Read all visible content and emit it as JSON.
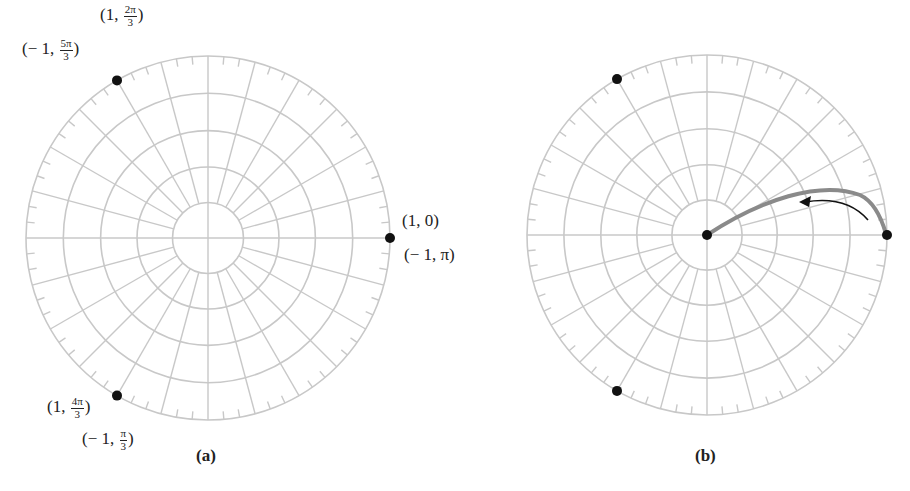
{
  "colors": {
    "grid": "#c8c8c8",
    "point": "#111111",
    "curve": "#8a8a8a",
    "arrow": "#111111",
    "text": "#222222"
  },
  "grid": {
    "rings": [
      0.195,
      0.39,
      0.59,
      0.795,
      1.0
    ],
    "spoke_step_deg": 15,
    "tick_step_deg": 5,
    "tick_length": 8
  },
  "panels": [
    {
      "id": "a",
      "caption": "(a)",
      "center": [
        208,
        238
      ],
      "radius": 182,
      "points_deg": [
        0,
        120,
        240
      ],
      "labels": [
        {
          "text_pre": "(1, ",
          "num": "2π",
          "den": "3",
          "text_post": ")",
          "x": 100,
          "y": 4
        },
        {
          "text_pre": "(− 1, ",
          "num": "5π",
          "den": "3",
          "text_post": ")",
          "x": 22,
          "y": 38
        },
        {
          "text_pre": "(1, 0)",
          "num": "",
          "den": "",
          "text_post": "",
          "x": 402,
          "y": 212
        },
        {
          "text_pre": "(− 1, π)",
          "num": "",
          "den": "",
          "text_post": "",
          "x": 404,
          "y": 246
        },
        {
          "text_pre": "(1, ",
          "num": "4π",
          "den": "3",
          "text_post": ")",
          "x": 47,
          "y": 396
        },
        {
          "text_pre": "(− 1, ",
          "num": "π",
          "den": "3",
          "text_post": ")",
          "x": 82,
          "y": 428
        }
      ],
      "caption_pos": [
        196,
        446
      ]
    },
    {
      "id": "b",
      "caption": "(b)",
      "center": [
        707,
        235
      ],
      "radius": 180,
      "points_deg": [
        0,
        120,
        240
      ],
      "center_point": true,
      "curve": {
        "description": "gray arc from origin bulging up to point (1,0)",
        "path": "M 707 235 C 760 200, 820 180, 860 195 C 875 202, 882 220, 886 234"
      },
      "arrow": {
        "path": "M 868 220 C 855 205, 835 197, 805 202",
        "direction": "counterclockwise"
      },
      "labels": [],
      "caption_pos": [
        695,
        446
      ]
    }
  ]
}
